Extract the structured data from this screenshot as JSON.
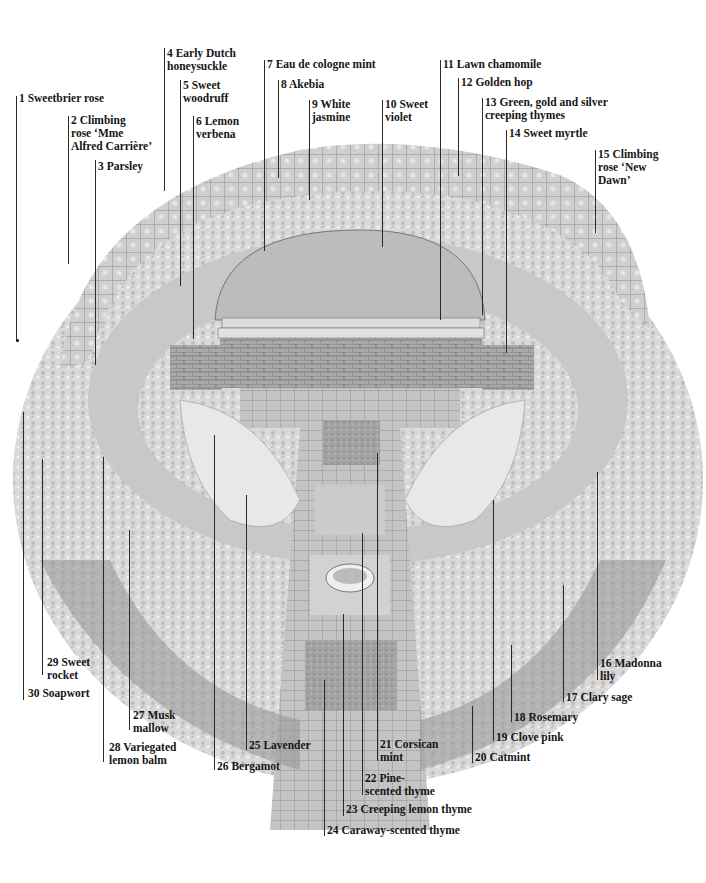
{
  "diagram": {
    "labels": [
      {
        "n": "1",
        "text": "1 Sweetbrier rose"
      },
      {
        "n": "2",
        "text": "2 Climbing\nrose ‘Mme\nAlfred Carrière’"
      },
      {
        "n": "3",
        "text": "3 Parsley"
      },
      {
        "n": "4",
        "text": "4 Early Dutch\nhoneysuckle"
      },
      {
        "n": "5",
        "text": "5 Sweet\nwoodruff"
      },
      {
        "n": "6",
        "text": "6 Lemon\nverbena"
      },
      {
        "n": "7",
        "text": "7 Eau de cologne mint"
      },
      {
        "n": "8",
        "text": "8 Akebia"
      },
      {
        "n": "9",
        "text": "9 White\njasmine"
      },
      {
        "n": "10",
        "text": "10 Sweet\nviolet"
      },
      {
        "n": "11",
        "text": "11 Lawn chamomile"
      },
      {
        "n": "12",
        "text": "12 Golden hop"
      },
      {
        "n": "13",
        "text": "13 Green, gold and silver\ncreeping thymes"
      },
      {
        "n": "14",
        "text": "14 Sweet myrtle"
      },
      {
        "n": "15",
        "text": "15 Climbing\nrose ‘New\nDawn’"
      },
      {
        "n": "16",
        "text": "16 Madonna\nlily"
      },
      {
        "n": "17",
        "text": "17 Clary sage"
      },
      {
        "n": "18",
        "text": "18 Rosemary"
      },
      {
        "n": "19",
        "text": "19 Clove pink"
      },
      {
        "n": "20",
        "text": "20 Catmint"
      },
      {
        "n": "21",
        "text": "21 Corsican\nmint"
      },
      {
        "n": "22",
        "text": "22 Pine-\nscented thyme"
      },
      {
        "n": "23",
        "text": "23 Creeping lemon thyme"
      },
      {
        "n": "24",
        "text": "24 Caraway-scented thyme"
      },
      {
        "n": "25",
        "text": "25 Lavender"
      },
      {
        "n": "26",
        "text": "26 Bergamot"
      },
      {
        "n": "27",
        "text": "27 Musk\nmallow"
      },
      {
        "n": "28",
        "text": "28 Variegated\nlemon balm"
      },
      {
        "n": "29",
        "text": "29 Sweet\nrocket"
      },
      {
        "n": "30",
        "text": "30 Soapwort"
      }
    ]
  }
}
